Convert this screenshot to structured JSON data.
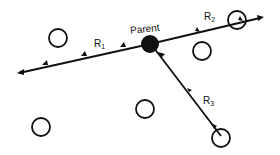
{
  "diagram": {
    "parent_label": "Parent",
    "routes": [
      {
        "id": "R1",
        "label_main": "R",
        "label_sub": "1"
      },
      {
        "id": "R2",
        "label_main": "R",
        "label_sub": "2"
      },
      {
        "id": "R3",
        "label_main": "R",
        "label_sub": "3"
      }
    ],
    "colors": {
      "stroke": "#111111",
      "background": "#ffffff"
    }
  }
}
